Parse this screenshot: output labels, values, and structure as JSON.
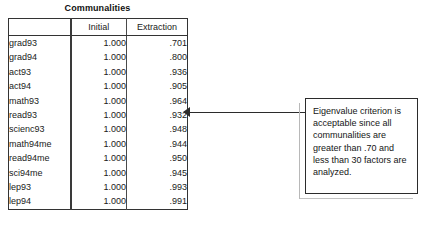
{
  "table": {
    "title": "Communalities",
    "columns": [
      "",
      "Initial",
      "Extraction"
    ],
    "rows": [
      {
        "label": "grad93",
        "initial": "1.000",
        "extraction": ".701"
      },
      {
        "label": "grad94",
        "initial": "1.000",
        "extraction": ".800"
      },
      {
        "label": "act93",
        "initial": "1.000",
        "extraction": ".936"
      },
      {
        "label": "act94",
        "initial": "1.000",
        "extraction": ".905"
      },
      {
        "label": "math93",
        "initial": "1.000",
        "extraction": ".964"
      },
      {
        "label": "read93",
        "initial": "1.000",
        "extraction": ".932"
      },
      {
        "label": "scienc93",
        "initial": "1.000",
        "extraction": ".948"
      },
      {
        "label": "math94me",
        "initial": "1.000",
        "extraction": ".944"
      },
      {
        "label": "read94me",
        "initial": "1.000",
        "extraction": ".950"
      },
      {
        "label": "sci94me",
        "initial": "1.000",
        "extraction": ".945"
      },
      {
        "label": "lep93",
        "initial": "1.000",
        "extraction": ".993"
      },
      {
        "label": "lep94",
        "initial": "1.000",
        "extraction": ".991"
      }
    ]
  },
  "annotation": {
    "text": "Eigenvalue criterion is acceptable since all communalities are greater than .70 and less than 30 factors are analyzed."
  },
  "colors": {
    "background": "#ffffff",
    "text": "#1a1a1a",
    "rule": "#333333",
    "callout_border": "#2b2b2b",
    "leader": "#2b2b2b"
  }
}
